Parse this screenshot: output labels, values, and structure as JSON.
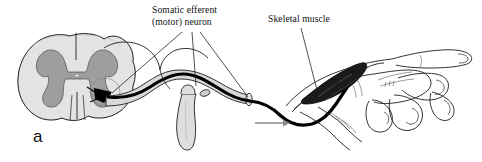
{
  "figure": {
    "panel_letter": "a",
    "background_color": "#ffffff",
    "width": 482,
    "height": 162,
    "caption_language": "en"
  },
  "labels": [
    {
      "id": "somatic-efferent-neuron",
      "line1": "Somatic efferent",
      "line2": "(motor) neuron",
      "x": 152,
      "y": 12,
      "leader_count": 3
    },
    {
      "id": "skeletal-muscle",
      "line1": "Skeletal muscle",
      "line2": "",
      "x": 268,
      "y": 20,
      "leader_count": 1
    }
  ],
  "structures": {
    "spinal_cord": {
      "name": "spinal cord cross-section",
      "white_matter_color": "#e3e3e3",
      "gray_matter_color": "#9e9e9e",
      "outline_color": "#1d1d1d"
    },
    "cell_body": {
      "name": "motor neuron cell body",
      "color": "#000000",
      "location": "ventral horn of gray matter"
    },
    "axon": {
      "name": "motor axon",
      "color": "#000000",
      "stroke_width": 3.2
    },
    "nerve_sheath": {
      "name": "spinal nerve sheath",
      "color": "#d9d9d9",
      "outline_color": "#1d1d1d"
    },
    "vertebra": {
      "name": "vertebral transverse process",
      "color": "#dedede"
    },
    "skeletal_muscle": {
      "name": "skeletal muscle belly",
      "color": "#1a1a1a"
    },
    "hand": {
      "name": "hand and fingers",
      "color": "#ffffff",
      "outline_color": "#1d1d1d"
    },
    "conduction_arrow": {
      "name": "impulse direction arrow",
      "color": "#8a8a8a",
      "direction": "right"
    }
  },
  "colors": {
    "ink": "#111111",
    "outline": "#1d1d1d",
    "white_matter": "#e3e3e3",
    "gray_matter": "#9e9e9e",
    "nerve_sheath": "#d9d9d9",
    "vertebra": "#dedede",
    "muscle": "#1a1a1a",
    "arrow": "#8a8a8a",
    "background": "#ffffff"
  }
}
